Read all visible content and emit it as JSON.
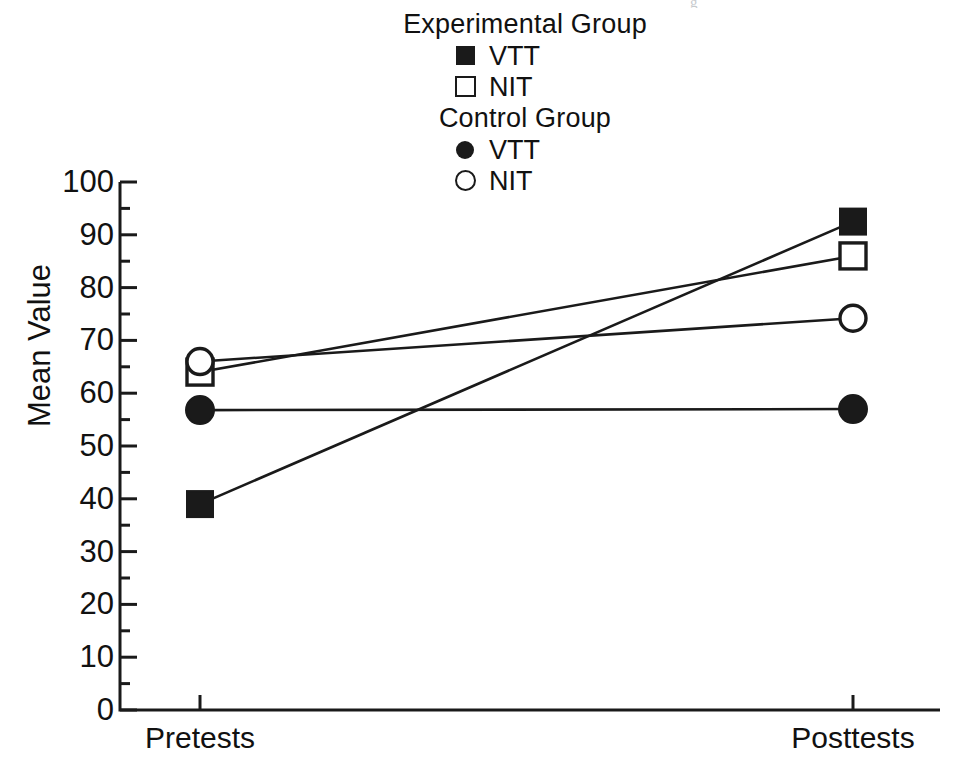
{
  "scan": {
    "header_fragment": "g"
  },
  "legend": {
    "groups": [
      {
        "title": "Experimental Group",
        "entries": [
          {
            "label": "VTT",
            "marker": "filled-square-icon"
          },
          {
            "label": "NIT",
            "marker": "open-square-icon"
          }
        ]
      },
      {
        "title": "Control Group",
        "entries": [
          {
            "label": "VTT",
            "marker": "filled-circle-icon"
          },
          {
            "label": "NIT",
            "marker": "open-circle-icon"
          }
        ]
      }
    ]
  },
  "chart_data": {
    "type": "line",
    "title": "",
    "xlabel": "",
    "ylabel": "Mean Value",
    "categories": [
      "Pretests",
      "Posttests"
    ],
    "x_tick_labels": [
      "Pretests",
      "Posttests"
    ],
    "y_tick_labels": [
      "0",
      "10",
      "20",
      "30",
      "40",
      "50",
      "60",
      "70",
      "80",
      "90",
      "100"
    ],
    "y_ticks": [
      0,
      10,
      20,
      30,
      40,
      50,
      60,
      70,
      80,
      90,
      100
    ],
    "y_minor_ticks": [
      5,
      15,
      25,
      35,
      45,
      55,
      65,
      75,
      85,
      95
    ],
    "ylim": [
      0,
      100
    ],
    "grid": false,
    "legend_position": "top-center",
    "series": [
      {
        "name": "Experimental Group VTT",
        "group": "Experimental Group",
        "measure": "VTT",
        "marker": "filled-square",
        "values": [
          39,
          92.5
        ]
      },
      {
        "name": "Experimental Group NIT",
        "group": "Experimental Group",
        "measure": "NIT",
        "marker": "open-square",
        "values": [
          64,
          86
        ]
      },
      {
        "name": "Control Group VTT",
        "group": "Control Group",
        "measure": "VTT",
        "marker": "filled-circle",
        "values": [
          56.8,
          57
        ]
      },
      {
        "name": "Control Group NIT",
        "group": "Control Group",
        "measure": "NIT",
        "marker": "open-circle",
        "values": [
          66,
          74.2
        ]
      }
    ],
    "colors": {
      "line": "#1a1a1a",
      "marker_fill": "#1a1a1a",
      "marker_open_fill": "#ffffff",
      "axis": "#1a1a1a",
      "background": "#ffffff"
    },
    "geometry": {
      "axis_x": 120,
      "axis_y_top": 182,
      "axis_y_bottom": 710,
      "axis_x_right": 940,
      "x_pretests": 200,
      "x_posttests": 853
    }
  }
}
